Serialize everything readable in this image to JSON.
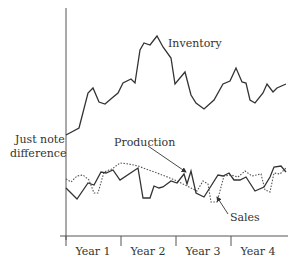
{
  "chart_data": {
    "type": "line",
    "title": "",
    "xlabel": "",
    "ylabel": "Just note difference",
    "ylabel_lines": [
      "Just note",
      "difference"
    ],
    "categories": [
      "Year 1",
      "Year 2",
      "Year 3",
      "Year 4"
    ],
    "grid": false,
    "legend": "inline annotations",
    "annotations": {
      "inventory": "Inventory",
      "production": "Production",
      "sales": "Sales"
    },
    "series": [
      {
        "name": "Inventory",
        "style": "solid",
        "points": [
          [
            66,
            135
          ],
          [
            79,
            128
          ],
          [
            88,
            93
          ],
          [
            93,
            88
          ],
          [
            99,
            102
          ],
          [
            105,
            104
          ],
          [
            112,
            98
          ],
          [
            118,
            93
          ],
          [
            123,
            83
          ],
          [
            131,
            79
          ],
          [
            135,
            83
          ],
          [
            140,
            50
          ],
          [
            144,
            43
          ],
          [
            150,
            45
          ],
          [
            157,
            36
          ],
          [
            163,
            47
          ],
          [
            171,
            58
          ],
          [
            175,
            84
          ],
          [
            185,
            72
          ],
          [
            191,
            95
          ],
          [
            196,
            103
          ],
          [
            204,
            109
          ],
          [
            214,
            100
          ],
          [
            223,
            84
          ],
          [
            230,
            81
          ],
          [
            236,
            68
          ],
          [
            242,
            82
          ],
          [
            246,
            83
          ],
          [
            250,
            100
          ],
          [
            255,
            103
          ],
          [
            263,
            93
          ],
          [
            267,
            84
          ],
          [
            273,
            92
          ],
          [
            277,
            88
          ],
          [
            286,
            84
          ]
        ]
      },
      {
        "name": "Production",
        "style": "solid",
        "points": [
          [
            66,
            188
          ],
          [
            77,
            199
          ],
          [
            88,
            183
          ],
          [
            94,
            185
          ],
          [
            101,
            172
          ],
          [
            106,
            173
          ],
          [
            113,
            170
          ],
          [
            120,
            180
          ],
          [
            138,
            168
          ],
          [
            143,
            198
          ],
          [
            150,
            198
          ],
          [
            154,
            186
          ],
          [
            159,
            188
          ],
          [
            163,
            187
          ],
          [
            171,
            181
          ],
          [
            177,
            183
          ],
          [
            184,
            174
          ],
          [
            187,
            184
          ],
          [
            191,
            171
          ],
          [
            196,
            193
          ],
          [
            204,
            197
          ],
          [
            211,
            186
          ],
          [
            218,
            175
          ],
          [
            223,
            176
          ],
          [
            229,
            173
          ],
          [
            234,
            180
          ],
          [
            240,
            180
          ],
          [
            246,
            177
          ],
          [
            255,
            191
          ],
          [
            264,
            187
          ],
          [
            270,
            177
          ],
          [
            274,
            167
          ],
          [
            281,
            166
          ],
          [
            286,
            172
          ]
        ]
      },
      {
        "name": "Sales",
        "style": "dotted",
        "points": [
          [
            66,
            179
          ],
          [
            71,
            182
          ],
          [
            77,
            176
          ],
          [
            83,
            175
          ],
          [
            89,
            180
          ],
          [
            94,
            193
          ],
          [
            98,
            193
          ],
          [
            104,
            172
          ],
          [
            112,
            169
          ],
          [
            120,
            163
          ],
          [
            129,
            164
          ],
          [
            138,
            166
          ],
          [
            165,
            176
          ],
          [
            177,
            181
          ],
          [
            185,
            185
          ],
          [
            197,
            191
          ],
          [
            203,
            181
          ],
          [
            208,
            184
          ],
          [
            211,
            202
          ],
          [
            217,
            202
          ],
          [
            224,
            176
          ],
          [
            231,
            175
          ],
          [
            238,
            177
          ],
          [
            245,
            171
          ],
          [
            252,
            176
          ],
          [
            261,
            174
          ],
          [
            265,
            190
          ],
          [
            270,
            192
          ],
          [
            274,
            173
          ],
          [
            280,
            174
          ],
          [
            286,
            168
          ]
        ]
      }
    ],
    "axis_pixels": {
      "x0": 66,
      "x_end": 288,
      "y_axis_top": 8,
      "y_axis_bottom": 240,
      "x_axis_y": 236,
      "tick_x": [
        66,
        121,
        176,
        231
      ]
    }
  }
}
